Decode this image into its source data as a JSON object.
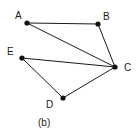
{
  "figure": {
    "caption": "(b)",
    "caption_x": 38,
    "caption_y": 118,
    "width": 139,
    "height": 139,
    "background_color": "#ffffff",
    "stroke_color": "#1a1a1a",
    "node_fill_color": "#111111",
    "label_color": "#1a1a1a",
    "node_radius": 2.6,
    "edge_width": 1
  },
  "chart_data": {
    "type": "diagram",
    "title": "(b)",
    "nodes": [
      {
        "id": "A",
        "label": "A",
        "x": 27,
        "y": 23,
        "label_x": 15,
        "label_y": 11
      },
      {
        "id": "B",
        "label": "B",
        "x": 98,
        "y": 24,
        "label_x": 103,
        "label_y": 12
      },
      {
        "id": "C",
        "label": "C",
        "x": 115,
        "y": 67,
        "label_x": 124,
        "label_y": 63
      },
      {
        "id": "D",
        "label": "D",
        "x": 63,
        "y": 98,
        "label_x": 46,
        "label_y": 100
      },
      {
        "id": "E",
        "label": "E",
        "x": 22,
        "y": 58,
        "label_x": 7,
        "label_y": 47
      }
    ],
    "edges": [
      {
        "from": "A",
        "to": "B"
      },
      {
        "from": "A",
        "to": "C"
      },
      {
        "from": "B",
        "to": "C"
      },
      {
        "from": "E",
        "to": "C"
      },
      {
        "from": "E",
        "to": "D"
      },
      {
        "from": "D",
        "to": "C"
      }
    ]
  }
}
